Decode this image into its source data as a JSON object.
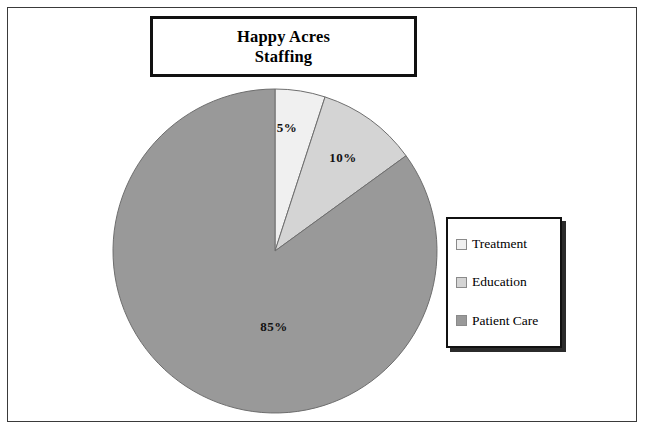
{
  "title": {
    "line1": "Happy Acres",
    "line2": "Staffing"
  },
  "chart_data": {
    "type": "pie",
    "title": "Happy Acres Staffing",
    "categories": [
      "Treatment",
      "Education",
      "Patient Care"
    ],
    "values": [
      5,
      10,
      85
    ],
    "value_labels": [
      "5%",
      "10%",
      "85%"
    ],
    "units": "percent",
    "start_angle_deg": 0,
    "direction": "clockwise",
    "colors": [
      "#f0f0f0",
      "#d4d4d4",
      "#999999"
    ],
    "slice_border_color": "#6e6e6e",
    "legend_position": "right",
    "grid": false,
    "slices": [
      {
        "label": "Treatment",
        "value": 5,
        "display": "5%",
        "color": "#f0f0f0"
      },
      {
        "label": "Education",
        "value": 10,
        "display": "10%",
        "color": "#d4d4d4"
      },
      {
        "label": "Patient Care",
        "value": 85,
        "display": "85%",
        "color": "#999999"
      }
    ]
  },
  "legend": {
    "items": [
      {
        "label": "Treatment",
        "color": "#f0f0f0"
      },
      {
        "label": "Education",
        "color": "#d4d4d4"
      },
      {
        "label": "Patient Care",
        "color": "#999999"
      }
    ]
  }
}
